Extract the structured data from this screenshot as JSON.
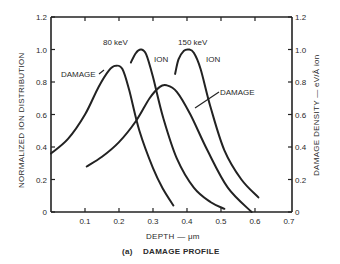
{
  "chart_data": {
    "type": "line",
    "title": "",
    "caption_prefix": "(a)",
    "caption": "DAMAGE PROFILE",
    "xlabel": "DEPTH — μm",
    "ylabel_left": "NORMALIZED ION DISTRIBUTION",
    "ylabel_right": "DAMAGE DENSITY — eV/Å ion",
    "xlim": [
      0,
      0.7
    ],
    "ylim": [
      0,
      1.2
    ],
    "x_ticks": [
      "0.1",
      "0.2",
      "0.3",
      "0.4",
      "0.5",
      "0.6",
      "0.7"
    ],
    "y_ticks_left": [
      "0",
      "0.2",
      "0.4",
      "0.6",
      "0.8",
      "1.0",
      "1.2"
    ],
    "y_ticks_right": [
      "0",
      "0.2",
      "0.4",
      "0.6",
      "0.8",
      "1.0",
      "1.2"
    ],
    "grid": false,
    "annotations": {
      "energy_80": "80 keV",
      "energy_150": "150 keV",
      "ion_80": "ION",
      "ion_150": "ION",
      "damage_80": "DAMAGE",
      "damage_150": "DAMAGE"
    },
    "series": [
      {
        "name": "80 keV DAMAGE",
        "x": [
          0.0,
          0.05,
          0.1,
          0.14,
          0.17,
          0.19,
          0.21,
          0.23,
          0.26,
          0.3,
          0.33,
          0.36
        ],
        "y": [
          0.36,
          0.45,
          0.6,
          0.77,
          0.87,
          0.9,
          0.88,
          0.75,
          0.5,
          0.27,
          0.14,
          0.04
        ]
      },
      {
        "name": "80 keV ION",
        "x": [
          0.235,
          0.25,
          0.265,
          0.28,
          0.3,
          0.33,
          0.37,
          0.42,
          0.47,
          0.51
        ],
        "y": [
          0.92,
          0.98,
          1.0,
          0.97,
          0.83,
          0.58,
          0.33,
          0.15,
          0.06,
          0.02
        ]
      },
      {
        "name": "150 keV DAMAGE",
        "x": [
          0.105,
          0.15,
          0.2,
          0.25,
          0.29,
          0.32,
          0.34,
          0.37,
          0.41,
          0.46,
          0.52,
          0.59
        ],
        "y": [
          0.28,
          0.34,
          0.43,
          0.56,
          0.7,
          0.77,
          0.78,
          0.74,
          0.6,
          0.38,
          0.15,
          0.0
        ]
      },
      {
        "name": "150 keV ION",
        "x": [
          0.365,
          0.375,
          0.39,
          0.405,
          0.42,
          0.44,
          0.47,
          0.51,
          0.56,
          0.61
        ],
        "y": [
          0.85,
          0.94,
          0.99,
          1.0,
          0.98,
          0.88,
          0.64,
          0.38,
          0.2,
          0.09
        ]
      }
    ]
  }
}
